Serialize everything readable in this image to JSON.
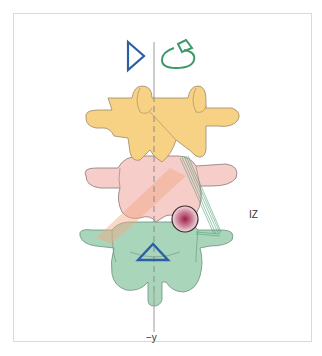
{
  "figure": {
    "labels": {
      "instability_zone": "IZ",
      "axis": "−y"
    },
    "symbols": {
      "top_left": "triangle-right-outline",
      "top_right": "rotation-arrow",
      "center_bottom": "triangle-up-outline"
    },
    "vertebrae": [
      {
        "name": "upper-vertebra",
        "color": "#f6cf7e"
      },
      {
        "name": "middle-vertebra",
        "color": "#f4c4c0"
      },
      {
        "name": "lower-vertebra",
        "color": "#9fd2b4"
      }
    ],
    "colors": {
      "frame": "#f0e27a",
      "axis": "#999999",
      "triangle": "#2c5fa3",
      "rotation_arrow": "#3a9a6a",
      "ligament": "#4f9f78",
      "lesion": "#9c1e4a",
      "force_band": "#f0a080"
    }
  }
}
